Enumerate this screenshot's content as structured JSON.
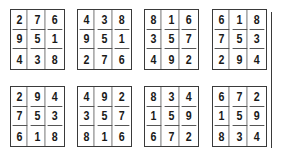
{
  "figure": {
    "squares": [
      {
        "row": 1,
        "col": 1,
        "cells": [
          [
            "2",
            "7",
            "6"
          ],
          [
            "9",
            "5",
            "1"
          ],
          [
            "4",
            "3",
            "8"
          ]
        ]
      },
      {
        "row": 1,
        "col": 2,
        "cells": [
          [
            "4",
            "3",
            "8"
          ],
          [
            "9",
            "5",
            "1"
          ],
          [
            "2",
            "7",
            "6"
          ]
        ]
      },
      {
        "row": 1,
        "col": 3,
        "cells": [
          [
            "8",
            "1",
            "6"
          ],
          [
            "3",
            "5",
            "7"
          ],
          [
            "4",
            "9",
            "2"
          ]
        ]
      },
      {
        "row": 1,
        "col": 4,
        "cells": [
          [
            "6",
            "1",
            "8"
          ],
          [
            "7",
            "5",
            "3"
          ],
          [
            "2",
            "9",
            "4"
          ]
        ]
      },
      {
        "row": 2,
        "col": 1,
        "cells": [
          [
            "2",
            "9",
            "4"
          ],
          [
            "7",
            "5",
            "3"
          ],
          [
            "6",
            "1",
            "8"
          ]
        ]
      },
      {
        "row": 2,
        "col": 2,
        "cells": [
          [
            "4",
            "9",
            "2"
          ],
          [
            "3",
            "5",
            "7"
          ],
          [
            "8",
            "1",
            "6"
          ]
        ]
      },
      {
        "row": 2,
        "col": 3,
        "cells": [
          [
            "8",
            "3",
            "4"
          ],
          [
            "1",
            "5",
            "9"
          ],
          [
            "6",
            "7",
            "2"
          ]
        ]
      },
      {
        "row": 2,
        "col": 4,
        "cells": [
          [
            "6",
            "7",
            "2"
          ],
          [
            "1",
            "5",
            "9"
          ],
          [
            "8",
            "3",
            "4"
          ]
        ]
      }
    ]
  }
}
